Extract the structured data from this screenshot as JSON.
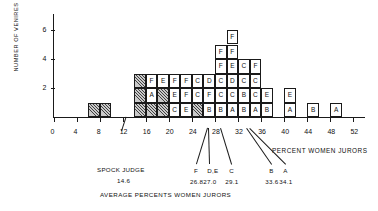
{
  "chart_data": {
    "type": "bar",
    "title": "",
    "xlabel": "PERCENT WOMEN JURORS",
    "ylabel": "NUMBER OF VENIRES",
    "xlim": [
      0,
      54
    ],
    "ylim": [
      0,
      6.5
    ],
    "xticks": [
      0,
      4,
      8,
      12,
      16,
      20,
      24,
      28,
      32,
      36,
      40,
      44,
      48,
      52
    ],
    "xtick_labels": [
      "0",
      "4",
      "8",
      "12",
      "16",
      "20",
      "24",
      "28",
      "32",
      "36",
      "40",
      "44",
      "48",
      "52"
    ],
    "yticks": [
      2,
      4,
      6
    ],
    "ytick_labels": [
      "2",
      "4",
      "6"
    ],
    "grid": false,
    "legend": "none",
    "bin_width": 2,
    "note": "Stacked unit blocks; each block is one venire, labeled with the judge letter A-F. Hatched blocks are unlabeled venires.",
    "bins": [
      {
        "x_left": 6,
        "x_right": 8,
        "count": 1,
        "stack": [
          "hatch"
        ]
      },
      {
        "x_left": 8,
        "x_right": 10,
        "count": 1,
        "stack": [
          "hatch"
        ]
      },
      {
        "x_left": 14,
        "x_right": 16,
        "count": 3,
        "stack": [
          "hatch",
          "hatch",
          "hatch"
        ]
      },
      {
        "x_left": 16,
        "x_right": 18,
        "count": 3,
        "stack": [
          "hatch",
          "A",
          "F"
        ]
      },
      {
        "x_left": 18,
        "x_right": 20,
        "count": 3,
        "stack": [
          "hatch",
          "hatch",
          "E"
        ]
      },
      {
        "x_left": 20,
        "x_right": 22,
        "count": 3,
        "stack": [
          "C",
          "E",
          "F"
        ]
      },
      {
        "x_left": 22,
        "x_right": 24,
        "count": 3,
        "stack": [
          "E",
          "F",
          "F"
        ]
      },
      {
        "x_left": 24,
        "x_right": 26,
        "count": 3,
        "stack": [
          "hatch",
          "C",
          "C"
        ]
      },
      {
        "x_left": 26,
        "x_right": 28,
        "count": 3,
        "stack": [
          "B",
          "F",
          "D"
        ]
      },
      {
        "x_left": 28,
        "x_right": 30,
        "count": 5,
        "stack": [
          "B",
          "C",
          "C",
          "F",
          "F"
        ]
      },
      {
        "x_left": 30,
        "x_right": 32,
        "count": 6,
        "stack": [
          "A",
          "C",
          "D",
          "E",
          "F",
          "F"
        ]
      },
      {
        "x_left": 32,
        "x_right": 34,
        "count": 4,
        "stack": [
          "B",
          "B",
          "C",
          "C"
        ]
      },
      {
        "x_left": 34,
        "x_right": 36,
        "count": 4,
        "stack": [
          "A",
          "C",
          "C",
          "F"
        ]
      },
      {
        "x_left": 36,
        "x_right": 38,
        "count": 2,
        "stack": [
          "B",
          "E"
        ]
      },
      {
        "x_left": 40,
        "x_right": 42,
        "count": 2,
        "stack": [
          "A",
          "E"
        ]
      },
      {
        "x_left": 44,
        "x_right": 46,
        "count": 1,
        "stack": [
          "B"
        ]
      },
      {
        "x_left": 48,
        "x_right": 50,
        "count": 1,
        "stack": [
          "A"
        ]
      }
    ],
    "annotations": {
      "group_label_left": "SPOCK JUDGE",
      "group_value_left": "14.6",
      "group_label_bottom": "AVERAGE PERCENTS  WOMEN JURORS",
      "markers": [
        {
          "letter": "F",
          "value": "26.8",
          "x": 26.8
        },
        {
          "letter": "D,E",
          "value": "27.0",
          "x": 27.0
        },
        {
          "letter": "C",
          "value": "29.1",
          "x": 29.1
        },
        {
          "letter": "B",
          "value": "33.6",
          "x": 33.6
        },
        {
          "letter": "A",
          "value": "34.1",
          "x": 34.1
        }
      ]
    },
    "colors": {
      "ink": "#1a1a1a",
      "hatch_fill": "#c9c9c9",
      "background": "#ffffff"
    }
  }
}
